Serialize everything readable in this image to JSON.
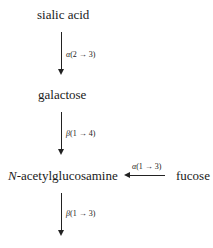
{
  "diagram": {
    "nodes": {
      "sialic_acid": "sialic acid",
      "galactose": "galactose",
      "glcnac_prefix": "N",
      "glcnac_rest": "-acetylglucosamine",
      "fucose": "fucose"
    },
    "edges": [
      {
        "from": "sialic acid",
        "to": "galactose",
        "greek": "α",
        "bond": "(2 → 3)"
      },
      {
        "from": "galactose",
        "to": "N-acetylglucosamine",
        "greek": "β",
        "bond": "(1 → 4)"
      },
      {
        "from": "fucose",
        "to": "N-acetylglucosamine",
        "greek": "α",
        "bond": "(1 → 3)"
      },
      {
        "from": "N-acetylglucosamine",
        "to": "",
        "greek": "β",
        "bond": "(1 → 3)"
      }
    ]
  }
}
